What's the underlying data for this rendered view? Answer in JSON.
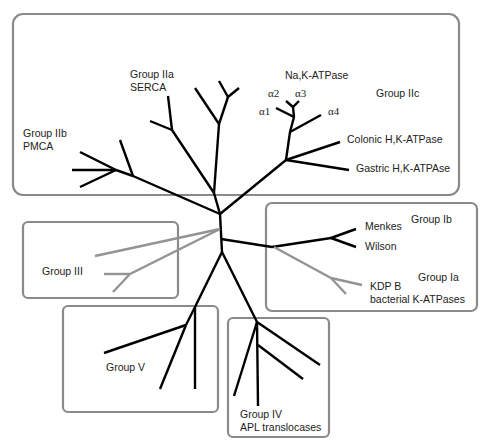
{
  "colors": {
    "branch": "#000000",
    "grey_branch": "#939393",
    "box_border": "#8a8a8a",
    "text": "#222222"
  },
  "groups": {
    "IIa": {
      "name": "Group IIa",
      "sub": "SERCA"
    },
    "IIb": {
      "name": "Group IIb",
      "sub": "PMCA"
    },
    "IIc": {
      "name": "Group IIc",
      "nak": "Na,K-ATPase",
      "alpha1": "α1",
      "alpha2": "α2",
      "alpha3": "α3",
      "alpha4": "α4",
      "colonic": "Colonic H,K-ATPase",
      "gastric": "Gastric H,K-ATPAse"
    },
    "Ib": {
      "name": "Group Ib",
      "menkes": "Menkes",
      "wilson": "Wilson"
    },
    "Ia": {
      "name": "Group Ia",
      "kdp": "KDP B",
      "sub": "bacterial K-ATPases"
    },
    "III": {
      "name": "Group III"
    },
    "V": {
      "name": "Group V"
    },
    "IV": {
      "name": "Group IV",
      "sub": "APL translocases"
    }
  }
}
